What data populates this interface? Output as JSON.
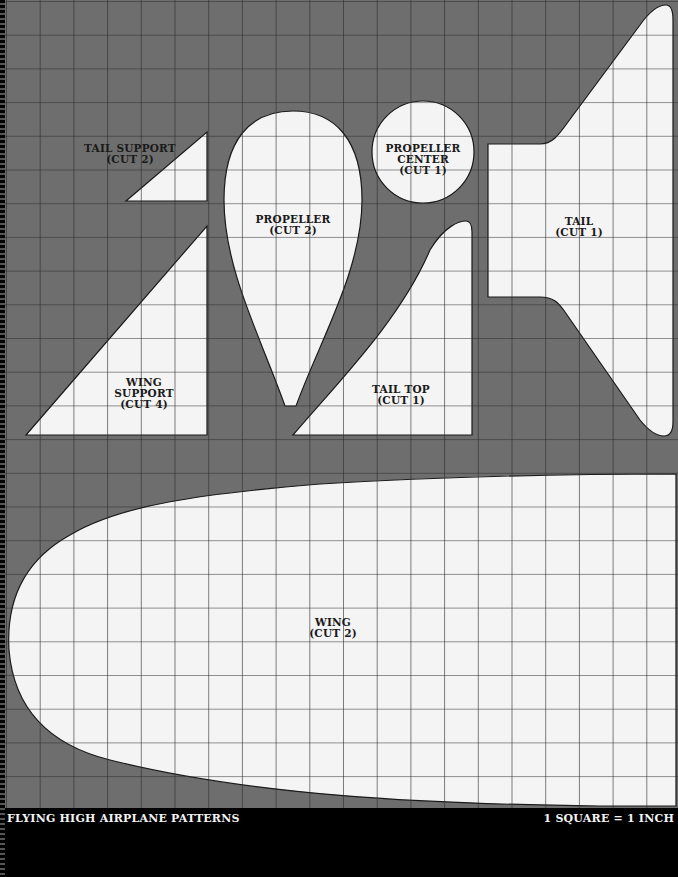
{
  "document": {
    "title": "FLYING HIGH AIRPLANE PATTERNS",
    "scale_note": "1 SQUARE = 1 INCH"
  },
  "colors": {
    "background_gray": "#6e6e6e",
    "piece_fill": "#f4f4f4",
    "grid_line": "#2a2a2a",
    "footer_bg": "#000000",
    "footer_text": "#f2f2f2"
  },
  "grid": {
    "square_size_px": 33.7,
    "unit": "1 inch"
  },
  "pieces": {
    "tail_support": {
      "name": "TAIL SUPPORT",
      "cut": "(CUT 2)"
    },
    "propeller": {
      "name": "PROPELLER",
      "cut": "(CUT 2)"
    },
    "propeller_center": {
      "name_line1": "PROPELLER",
      "name_line2": "CENTER",
      "cut": "(CUT 1)"
    },
    "tail": {
      "name": "TAIL",
      "cut": "(CUT 1)"
    },
    "wing_support": {
      "name_line1": "WING",
      "name_line2": "SUPPORT",
      "cut": "(CUT 4)"
    },
    "tail_top": {
      "name": "TAIL TOP",
      "cut": "(CUT 1)"
    },
    "wing": {
      "name": "WING",
      "cut": "(CUT 2)"
    }
  }
}
